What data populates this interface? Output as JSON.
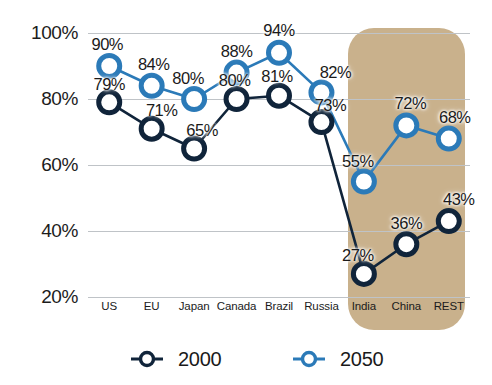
{
  "chart_data": {
    "type": "line",
    "title": "",
    "subtitle": "",
    "xlabel": "",
    "ylabel": "",
    "categories": [
      "US",
      "EU",
      "Japan",
      "Canada",
      "Brazil",
      "Russia",
      "India",
      "China",
      "REST"
    ],
    "series": [
      {
        "name": "2000",
        "color": "#10243a",
        "values": [
          79,
          71,
          65,
          80,
          81,
          73,
          27,
          36,
          43
        ],
        "labels": [
          "79%",
          "71%",
          "65%",
          "80%",
          "81%",
          "73%",
          "27%",
          "36%",
          "43%"
        ]
      },
      {
        "name": "2050",
        "color": "#2b7ab8",
        "values": [
          90,
          84,
          80,
          88,
          94,
          82,
          55,
          72,
          68
        ],
        "labels": [
          "90%",
          "84%",
          "80%",
          "88%",
          "94%",
          "82%",
          "55%",
          "72%",
          "68%"
        ]
      }
    ],
    "ylim": [
      20,
      100
    ],
    "yticks": [
      100,
      80,
      60,
      40,
      20
    ],
    "ytick_labels": [
      "100%",
      "80%",
      "60%",
      "40%",
      "20%"
    ],
    "grid": true,
    "legend_position": "bottom",
    "value_labels_shown": true,
    "highlight": {
      "name": "emerging-markets-band",
      "categories": [
        "India",
        "China",
        "REST"
      ],
      "color": "#c9b18c"
    }
  },
  "legend": {
    "items": [
      {
        "label": "2000",
        "color": "#10243a"
      },
      {
        "label": "2050",
        "color": "#2b7ab8"
      }
    ]
  }
}
